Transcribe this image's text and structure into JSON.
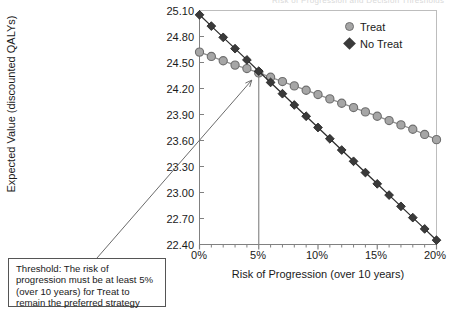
{
  "figure": {
    "title_remnant": "Risk of Progression and Decision Thresholds"
  },
  "legend": {
    "position": "top-right",
    "items": [
      {
        "label": "Treat",
        "marker": "circle-marker-icon",
        "color": "#a6a6a6"
      },
      {
        "label": "No Treat",
        "marker": "diamond-marker-icon",
        "color": "#3a3a3a"
      }
    ]
  },
  "annotation": {
    "text": "Threshold: The risk of progression must be at least 5% (over 10 years) for Treat to remain the preferred strategy"
  },
  "axes": {
    "ylabel": "Expected Value (discounted QALYs)",
    "xlabel": "Risk of Progression (over 10 years)",
    "yticks": [
      "25.10",
      "24.80",
      "24.50",
      "24.20",
      "23.90",
      "23.60",
      "23.30",
      "23.00",
      "22.70",
      "22.40"
    ],
    "xticks": [
      "0%",
      "5%",
      "10%",
      "15%",
      "20%"
    ]
  },
  "chart_data": {
    "type": "line",
    "title": "",
    "xlabel": "Risk of Progression (over 10 years)",
    "ylabel": "Expected Value (discounted QALYs)",
    "xlim": [
      0,
      20
    ],
    "ylim": [
      22.4,
      25.1
    ],
    "grid": false,
    "legend_position": "top-right",
    "x": [
      0,
      1,
      2,
      3,
      4,
      5,
      6,
      7,
      8,
      9,
      10,
      11,
      12,
      13,
      14,
      15,
      16,
      17,
      18,
      19,
      20
    ],
    "xtick_values": [
      0,
      5,
      10,
      15,
      20
    ],
    "ytick_values": [
      22.4,
      22.7,
      23.0,
      23.3,
      23.6,
      23.9,
      24.2,
      24.5,
      24.8,
      25.1
    ],
    "series": [
      {
        "name": "Treat",
        "color": "#a6a6a6",
        "marker": "circle",
        "values": [
          24.62,
          24.57,
          24.52,
          24.47,
          24.43,
          24.38,
          24.33,
          24.28,
          24.23,
          24.18,
          24.13,
          24.08,
          24.03,
          23.98,
          23.93,
          23.88,
          23.83,
          23.78,
          23.73,
          23.67,
          23.61
        ]
      },
      {
        "name": "No Treat",
        "color": "#3a3a3a",
        "marker": "diamond",
        "values": [
          25.05,
          24.92,
          24.79,
          24.66,
          24.53,
          24.4,
          24.27,
          24.14,
          24.01,
          23.88,
          23.75,
          23.62,
          23.49,
          23.36,
          23.23,
          23.1,
          22.97,
          22.84,
          22.71,
          22.58,
          22.45
        ]
      }
    ],
    "annotations": [
      {
        "type": "threshold-line",
        "x": 5,
        "y": 24.4,
        "label": "Threshold: The risk of progression must be at least 5% (over 10 years) for Treat to remain the preferred strategy"
      }
    ]
  }
}
